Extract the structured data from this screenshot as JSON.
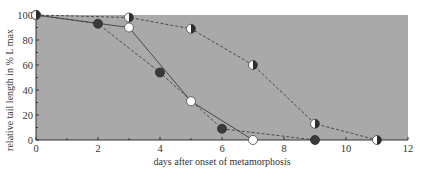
{
  "chart_data": {
    "type": "line",
    "title": "",
    "xlabel": "days after onset of metamorphosis",
    "ylabel": "relative tail length in % L max",
    "xlim": [
      0,
      12
    ],
    "ylim": [
      0,
      100
    ],
    "x_ticks": [
      0,
      2,
      4,
      6,
      8,
      10,
      12
    ],
    "y_ticks": [
      0,
      20,
      40,
      60,
      80,
      100
    ],
    "grid": false,
    "legend": null,
    "plot_background": "#a9a9a9",
    "series": [
      {
        "name": "filled circles",
        "marker": "filled",
        "line_style": "dashed",
        "points": [
          [
            0,
            100
          ],
          [
            2,
            93
          ],
          [
            4,
            54
          ],
          [
            6,
            9
          ],
          [
            9,
            0
          ]
        ]
      },
      {
        "name": "open circles",
        "marker": "open",
        "line_style": "solid",
        "points": [
          [
            0,
            100
          ],
          [
            3,
            90
          ],
          [
            5,
            31
          ],
          [
            7,
            0
          ]
        ]
      },
      {
        "name": "half-filled circles",
        "marker": "half",
        "line_style": "dashed",
        "points": [
          [
            0,
            100
          ],
          [
            3,
            98
          ],
          [
            5,
            89
          ],
          [
            7,
            60
          ],
          [
            9,
            13
          ],
          [
            11,
            0
          ]
        ]
      }
    ]
  }
}
